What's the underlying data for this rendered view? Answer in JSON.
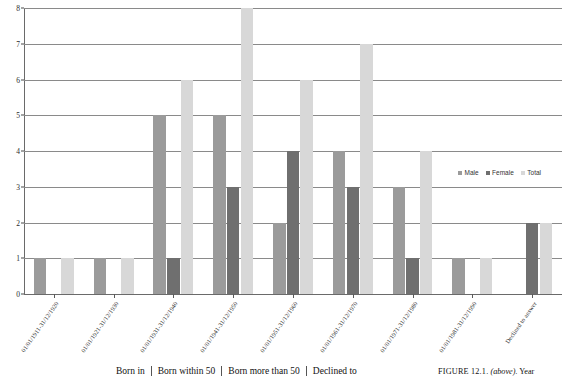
{
  "chart_data": {
    "type": "bar",
    "title": "",
    "xlabel": "",
    "ylabel": "",
    "ylim": [
      0,
      8
    ],
    "ytick_values": [
      0,
      1,
      2,
      3,
      4,
      5,
      6,
      7,
      8
    ],
    "grid": true,
    "legend_position": "inside-right",
    "categories": [
      "01/01/1911-31/12/1920",
      "01/01/1921-31/12/1930",
      "01/01/1931-31/12/1940",
      "01/01/1941-31/12/1950",
      "01/01/1951-31/12/1960",
      "01/01/1961-31/12/1970",
      "01/01/1971-31/12/1980",
      "01/01/1981-31/12/1990",
      "Declined to answer"
    ],
    "series": [
      {
        "name": "Male",
        "color": "#9b9b9b",
        "values": [
          1,
          1,
          5,
          5,
          2,
          4,
          3,
          1,
          0
        ]
      },
      {
        "name": "Female",
        "color": "#6f6f6f",
        "values": [
          0,
          0,
          1,
          3,
          4,
          3,
          1,
          0,
          2
        ]
      },
      {
        "name": "Total",
        "color": "#d8d8d8",
        "values": [
          1,
          1,
          6,
          8,
          6,
          7,
          4,
          1,
          2
        ]
      }
    ]
  },
  "legend": {
    "items": [
      {
        "label": "Male",
        "color": "#9b9b9b"
      },
      {
        "label": "Female",
        "color": "#6f6f6f"
      },
      {
        "label": "Total",
        "color": "#d8d8d8"
      }
    ]
  },
  "bottom": {
    "table_header_cells": [
      "Born in",
      "Born within 50",
      "Born more than 50",
      "Declined to"
    ],
    "figure_caption": {
      "label": "FIGURE 12.1.",
      "position_note": "(above).",
      "text": "Year"
    }
  }
}
